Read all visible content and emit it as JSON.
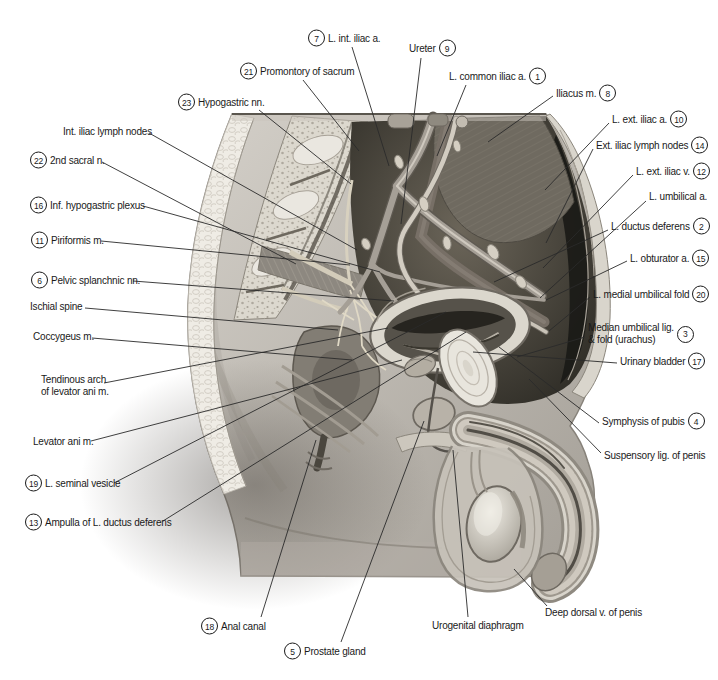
{
  "page": {
    "background": "#ffffff"
  },
  "colors": {
    "label_text": "#1a1a1a",
    "leader_line": "#2a2a2a",
    "badge_border": "#1a1a1a",
    "badge_bg": "#ffffff",
    "illustration_dark": "#2c2a26",
    "illustration_light": "#d8d4cb"
  },
  "figure": {
    "labels": [
      {
        "id": "l-int-iliac-a",
        "text": "L. int. iliac a.",
        "number": 7,
        "number_pos": "before",
        "x": 308,
        "y": 38,
        "leader": [
          352,
          47,
          389,
          166
        ]
      },
      {
        "id": "ureter",
        "text": "Ureter",
        "number": 9,
        "number_pos": "after",
        "x": 409,
        "y": 48,
        "leader": [
          421,
          58,
          401,
          224
        ]
      },
      {
        "id": "promontory-of-sacrum",
        "text": "Promontory of sacrum",
        "number": 21,
        "number_pos": "before",
        "x": 240,
        "y": 71,
        "leader": [
          303,
          80,
          359,
          151
        ]
      },
      {
        "id": "l-common-iliac-a",
        "text": "L. common iliac a.",
        "number": 1,
        "number_pos": "after",
        "x": 449,
        "y": 76,
        "leader": [
          466,
          85,
          437,
          156
        ]
      },
      {
        "id": "hypogastric-nn",
        "text": "Hypogastric nn.",
        "number": 23,
        "number_pos": "before",
        "x": 178,
        "y": 102,
        "leader": [
          259,
          110,
          351,
          184
        ]
      },
      {
        "id": "iliacus-m",
        "text": "Iliacus m.",
        "number": 8,
        "number_pos": "after",
        "x": 556,
        "y": 93,
        "leader": [
          553,
          96,
          488,
          142
        ]
      },
      {
        "id": "int-iliac-lymph-nodes",
        "text": "Int. iliac lymph nodes",
        "number": null,
        "number_pos": null,
        "x": 63,
        "y": 132,
        "leader": [
          149,
          133,
          357,
          250
        ]
      },
      {
        "id": "second-sacral-n",
        "text": "2nd sacral n.",
        "number": 22,
        "number_pos": "before",
        "x": 30,
        "y": 160,
        "leader": [
          102,
          162,
          296,
          264
        ]
      },
      {
        "id": "inf-hypogastric-plexus",
        "text": "Inf. hypogastric plexus",
        "number": 16,
        "number_pos": "before",
        "x": 30,
        "y": 205,
        "leader": [
          143,
          206,
          380,
          272
        ]
      },
      {
        "id": "piriformis-m",
        "text": "Piriformis m.",
        "number": 11,
        "number_pos": "before",
        "x": 31,
        "y": 240,
        "leader": [
          101,
          241,
          350,
          265
        ]
      },
      {
        "id": "pelvic-splanchnic-nn",
        "text": "Pelvic splanchnic nn.",
        "number": 6,
        "number_pos": "before",
        "x": 31,
        "y": 280,
        "leader": [
          133,
          281,
          394,
          301
        ]
      },
      {
        "id": "ischial-spine",
        "text": "Ischial spine",
        "number": null,
        "number_pos": null,
        "x": 30,
        "y": 307,
        "leader": [
          85,
          308,
          338,
          330
        ]
      },
      {
        "id": "coccygeus-m",
        "text": "Coccygeus m.",
        "number": null,
        "number_pos": null,
        "x": 33,
        "y": 337,
        "leader": [
          92,
          338,
          352,
          360
        ]
      },
      {
        "id": "tendinous-arch",
        "lines": [
          "Tendinous arch",
          "of levator ani m."
        ],
        "number": null,
        "number_pos": null,
        "x": 41,
        "y": 386,
        "leader": [
          104,
          383,
          388,
          328
        ]
      },
      {
        "id": "levator-ani-m",
        "text": "Levator ani m.",
        "number": null,
        "number_pos": null,
        "x": 33,
        "y": 442,
        "leader": [
          91,
          441,
          402,
          360
        ]
      },
      {
        "id": "l-seminal-vesicle",
        "text": "L. seminal vesicle",
        "number": 19,
        "number_pos": "before",
        "x": 25,
        "y": 483,
        "leader": [
          114,
          483,
          446,
          312
        ]
      },
      {
        "id": "ampulla-of-l-ductus-deferens",
        "text": "Ampulla of L. ductus deferens",
        "number": 13,
        "number_pos": "before",
        "x": 25,
        "y": 522,
        "leader": [
          163,
          521,
          466,
          332
        ]
      },
      {
        "id": "l-ext-iliac-a",
        "text": "L. ext. iliac a.",
        "number": 10,
        "number_pos": "after",
        "x": 612,
        "y": 119,
        "leader": [
          609,
          123,
          545,
          190
        ]
      },
      {
        "id": "ext-iliac-lymph-nodes",
        "text": "Ext. iliac lymph nodes",
        "number": 14,
        "number_pos": "after",
        "x": 596,
        "y": 145,
        "leader": [
          593,
          149,
          546,
          243
        ]
      },
      {
        "id": "l-ext-iliac-v",
        "text": "L. ext. iliac v.",
        "number": 12,
        "number_pos": "after",
        "x": 636,
        "y": 171,
        "leader": [
          633,
          175,
          543,
          268
        ]
      },
      {
        "id": "l-umbilical-a",
        "text": "L. umbilical a.",
        "number": null,
        "number_pos": null,
        "x": 649,
        "y": 197,
        "leader": [
          646,
          201,
          540,
          298
        ]
      },
      {
        "id": "l-ductus-deferens",
        "text": "L. ductus deferens",
        "number": 2,
        "number_pos": "after",
        "x": 611,
        "y": 226,
        "leader": [
          608,
          230,
          494,
          282
        ]
      },
      {
        "id": "l-obturator-a",
        "text": "L. obturator a.",
        "number": 15,
        "number_pos": "after",
        "x": 630,
        "y": 258,
        "leader": [
          627,
          261,
          546,
          300
        ]
      },
      {
        "id": "l-medial-umbilical-fold",
        "text": "L. medial umbilical fold",
        "number": 20,
        "number_pos": "after",
        "x": 593,
        "y": 294,
        "leader": [
          590,
          297,
          549,
          331
        ]
      },
      {
        "id": "median-umbilical-lig",
        "lines": [
          "Median umbilical lig.",
          "& fold (urachus)"
        ],
        "number": 3,
        "number_pos": "after",
        "x": 588,
        "y": 334,
        "leader": [
          585,
          337,
          517,
          357
        ]
      },
      {
        "id": "urinary-bladder",
        "text": "Urinary bladder",
        "number": 17,
        "number_pos": "after",
        "x": 620,
        "y": 361,
        "leader": [
          617,
          363,
          473,
          352
        ]
      },
      {
        "id": "symphysis-of-pubis",
        "text": "Symphysis of pubis",
        "number": 4,
        "number_pos": "after",
        "x": 602,
        "y": 421,
        "leader": [
          599,
          423,
          499,
          347
        ]
      },
      {
        "id": "suspensory-lig-of-penis",
        "text": "Suspensory lig. of penis",
        "number": null,
        "number_pos": null,
        "x": 604,
        "y": 456,
        "leader": [
          601,
          453,
          529,
          379
        ]
      },
      {
        "id": "deep-dorsal-v-of-penis",
        "text": "Deep dorsal v. of penis",
        "number": null,
        "number_pos": null,
        "x": 545,
        "y": 613,
        "leader": [
          547,
          606,
          514,
          569
        ]
      },
      {
        "id": "anal-canal",
        "text": "Anal canal",
        "number": 18,
        "number_pos": "before",
        "x": 201,
        "y": 626,
        "leader": [
          261,
          617,
          316,
          440
        ]
      },
      {
        "id": "prostate-gland",
        "text": "Prostate gland",
        "number": 5,
        "number_pos": "before",
        "x": 284,
        "y": 651,
        "leader": [
          341,
          642,
          424,
          421
        ]
      },
      {
        "id": "urogenital-diaphragm",
        "text": "Urogenital diaphragm",
        "number": null,
        "number_pos": null,
        "x": 432,
        "y": 626,
        "leader": [
          468,
          617,
          453,
          450
        ]
      }
    ]
  }
}
